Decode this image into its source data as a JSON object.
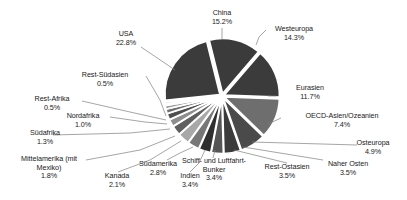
{
  "chart_data": {
    "type": "pie",
    "title": "",
    "unit": "%",
    "legend": "none (direct labels with leader lines)",
    "exploded": true,
    "start_angle_deg": -14,
    "categories": [
      "China",
      "Westeuropa",
      "Eurasien",
      "OECD-Asien/Ozeanien",
      "Osteuropa",
      "Naher Osten",
      "Rest-Ostasien",
      "Schiff- und Luftfahrt-Bunker",
      "Indien",
      "Südamerika",
      "Kanada",
      "Mittelamerika (mit Mexiko)",
      "Südafrika",
      "Nordafrika",
      "Rest-Afrika",
      "Rest-Südasien",
      "USA"
    ],
    "values": [
      15.2,
      14.3,
      11.7,
      7.4,
      4.9,
      3.5,
      3.5,
      3.4,
      3.4,
      2.8,
      2.1,
      1.8,
      1.3,
      1.0,
      0.5,
      0.5,
      22.8
    ],
    "value_labels": [
      "15.2%",
      "14.3%",
      "11.7%",
      "7.4%",
      "4.9%",
      "3.5%",
      "3.5%",
      "3.4%",
      "3.4%",
      "2.8%",
      "2.1%",
      "1.8%",
      "1.3%",
      "1.0%",
      "0.5%",
      "0.5%",
      "22.8%"
    ],
    "colors": [
      "#3b3b3b",
      "#3b3b3b",
      "#6e6e6e",
      "#4a4a4a",
      "#3b3b3b",
      "#555555",
      "#2f2f2f",
      "#777777",
      "#a8a8a8",
      "#5f5f5f",
      "#8e8e8e",
      "#4f4f4f",
      "#707070",
      "#9a9a9a",
      "#5a5a5a",
      "#848484",
      "#3b3b3b"
    ]
  },
  "labels": {
    "china": {
      "name": "China",
      "value": "15.2%"
    },
    "westeuropa": {
      "name": "Westeuropa",
      "value": "14.3%"
    },
    "eurasien": {
      "name": "Eurasien",
      "value": "11.7%"
    },
    "oecd_asien": {
      "name": "OECD-Asien/Ozeanien",
      "value": "7.4%"
    },
    "osteuropa": {
      "name": "Osteuropa",
      "value": "4.9%"
    },
    "naher_osten": {
      "name": "Naher Osten",
      "value": "3.5%"
    },
    "rest_ostasien": {
      "name": "Rest-Ostasien",
      "value": "3.5%"
    },
    "bunker": {
      "name": "Schiff- und Luftfahrt-",
      "name2": "Bunker",
      "value": "3.4%"
    },
    "indien": {
      "name": "Indien",
      "value": "3.4%"
    },
    "suedamerika": {
      "name": "Südamerika",
      "value": "2.8%"
    },
    "kanada": {
      "name": "Kanada",
      "value": "2.1%"
    },
    "mittelamerika": {
      "name": "Mittelamerika (mit",
      "name2": "Mexiko)",
      "value": "1.8%"
    },
    "suedafrika": {
      "name": "Südafrika",
      "value": "1.3%"
    },
    "nordafrika": {
      "name": "Nordafrika",
      "value": "1.0%"
    },
    "rest_afrika": {
      "name": "Rest-Afrika",
      "value": "0.5%"
    },
    "rest_suedasien": {
      "name": "Rest-Südasien",
      "value": "0.5%"
    },
    "usa": {
      "name": "USA",
      "value": "22.8%"
    }
  }
}
